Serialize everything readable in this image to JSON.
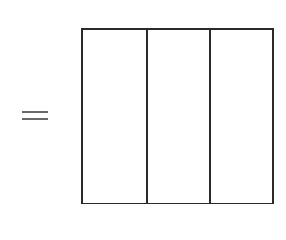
{
  "diagram": {
    "equals_symbol": "=",
    "shape": "rectangle",
    "partitions": 3,
    "parts": [
      {
        "index": 1,
        "shaded": false
      },
      {
        "index": 2,
        "shaded": false
      },
      {
        "index": 3,
        "shaded": false
      }
    ],
    "colors": {
      "stroke": "#2a2a2a",
      "equals": "#6a6a6a",
      "background": "#ffffff"
    }
  }
}
